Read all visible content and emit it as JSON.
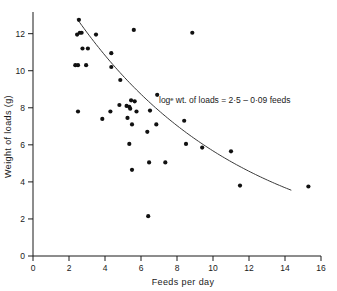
{
  "chart_data": {
    "type": "scatter",
    "title": "",
    "xlabel": "Feeds per day",
    "ylabel": "Weight of loads (g)",
    "xlim": [
      0,
      16
    ],
    "ylim": [
      0,
      12.9
    ],
    "xticks": [
      0,
      2,
      4,
      6,
      8,
      10,
      12,
      14,
      16
    ],
    "xtick_labels": [
      "0",
      "2",
      "4",
      "6",
      "8",
      "10",
      "12",
      "14",
      "16"
    ],
    "yticks": [
      0,
      2,
      4,
      6,
      8,
      10,
      12
    ],
    "ytick_labels": [
      "0",
      "2",
      "4",
      "6",
      "8",
      "10",
      "12"
    ],
    "grid": false,
    "legend": null,
    "annotation": "logᵉ wt. of loads = 2·5 – 0·09 feeds",
    "annotation_x": 7.0,
    "annotation_y": 8.25,
    "points": [
      {
        "x": 2.55,
        "y": 12.75
      },
      {
        "x": 2.45,
        "y": 11.95
      },
      {
        "x": 2.6,
        "y": 12.05
      },
      {
        "x": 2.7,
        "y": 12.05
      },
      {
        "x": 3.5,
        "y": 11.95
      },
      {
        "x": 5.6,
        "y": 12.2
      },
      {
        "x": 8.85,
        "y": 12.05
      },
      {
        "x": 2.75,
        "y": 11.2
      },
      {
        "x": 3.05,
        "y": 11.2
      },
      {
        "x": 4.35,
        "y": 10.95
      },
      {
        "x": 2.35,
        "y": 10.3
      },
      {
        "x": 2.5,
        "y": 10.3
      },
      {
        "x": 2.95,
        "y": 10.3
      },
      {
        "x": 4.35,
        "y": 10.2
      },
      {
        "x": 4.85,
        "y": 9.5
      },
      {
        "x": 6.9,
        "y": 8.7
      },
      {
        "x": 5.45,
        "y": 8.4
      },
      {
        "x": 5.65,
        "y": 8.35
      },
      {
        "x": 4.8,
        "y": 8.15
      },
      {
        "x": 5.2,
        "y": 8.1
      },
      {
        "x": 5.35,
        "y": 8.05
      },
      {
        "x": 5.4,
        "y": 7.95
      },
      {
        "x": 2.5,
        "y": 7.8
      },
      {
        "x": 4.3,
        "y": 7.8
      },
      {
        "x": 5.75,
        "y": 7.8
      },
      {
        "x": 6.5,
        "y": 7.85
      },
      {
        "x": 5.25,
        "y": 7.45
      },
      {
        "x": 3.85,
        "y": 7.4
      },
      {
        "x": 8.4,
        "y": 7.3
      },
      {
        "x": 5.5,
        "y": 7.1
      },
      {
        "x": 6.85,
        "y": 7.1
      },
      {
        "x": 6.35,
        "y": 6.7
      },
      {
        "x": 5.35,
        "y": 6.05
      },
      {
        "x": 8.5,
        "y": 6.05
      },
      {
        "x": 9.4,
        "y": 5.85
      },
      {
        "x": 11.0,
        "y": 5.65
      },
      {
        "x": 6.45,
        "y": 5.05
      },
      {
        "x": 7.35,
        "y": 5.05
      },
      {
        "x": 5.5,
        "y": 4.65
      },
      {
        "x": 11.5,
        "y": 3.8
      },
      {
        "x": 15.3,
        "y": 3.75
      },
      {
        "x": 6.4,
        "y": 2.15
      }
    ],
    "fit_curve": {
      "equation": "logᵉ wt. of loads = 2·5 – 0·09 feeds",
      "intercept": 2.5,
      "slope": -0.09,
      "x_start": 2.45,
      "x_end": 14.35,
      "y_start": 12.8,
      "y_end": 3.55
    }
  }
}
